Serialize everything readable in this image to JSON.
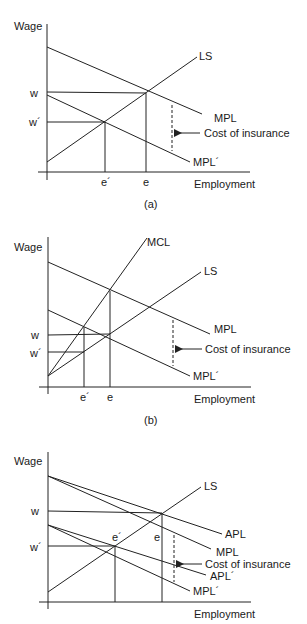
{
  "panels": [
    {
      "caption": "(a)",
      "y_axis_label": "Wage",
      "x_axis_label": "Employment",
      "y_ticks": [
        "w",
        "w´"
      ],
      "x_ticks": [
        "e´",
        "e"
      ],
      "curves": [
        "LS",
        "MPL",
        "MPL´"
      ],
      "annotation": "Cost of insurance"
    },
    {
      "caption": "(b)",
      "y_axis_label": "Wage",
      "x_axis_label": "Employment",
      "y_ticks": [
        "w",
        "w´"
      ],
      "x_ticks": [
        "e´",
        "e"
      ],
      "curves": [
        "MCL",
        "LS",
        "MPL",
        "MPL´"
      ],
      "annotation": "Cost of insurance"
    },
    {
      "caption": "",
      "y_axis_label": "Wage",
      "x_axis_label": "Employment",
      "y_ticks": [
        "w",
        "w´"
      ],
      "x_ticks": [
        "e´",
        "e"
      ],
      "curves": [
        "LS",
        "APL",
        "MPL",
        "APL´",
        "MPL´"
      ],
      "annotation": "Cost of insurance"
    }
  ]
}
